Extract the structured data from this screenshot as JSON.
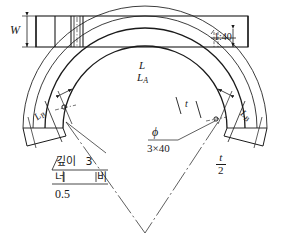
{
  "drawing": {
    "title": "Curved beam fabrication detail",
    "background_color": "#ffffff",
    "line_color": "#1a1a1a",
    "views": {
      "plan_view": {
        "name": "plan-view",
        "width_label": "W",
        "slit_label": "1:40"
      },
      "arc_view": {
        "name": "arc-view",
        "outer_arc_label": "L",
        "second_arc_label": "L",
        "second_arc_sub": "A",
        "left_end_label": "L",
        "left_end_sub": "B",
        "right_end_label": "L",
        "right_end_sub": "B",
        "thickness_label": "t",
        "hole_symbol": "ϕ",
        "hole_spec": "3×40",
        "half_thickness_num": "t",
        "half_thickness_den": "2"
      }
    },
    "notes": {
      "depth_label": "깊이",
      "depth_value": "3",
      "width_label_left": "너",
      "width_label_right": "비",
      "width_value": "0.5"
    }
  }
}
